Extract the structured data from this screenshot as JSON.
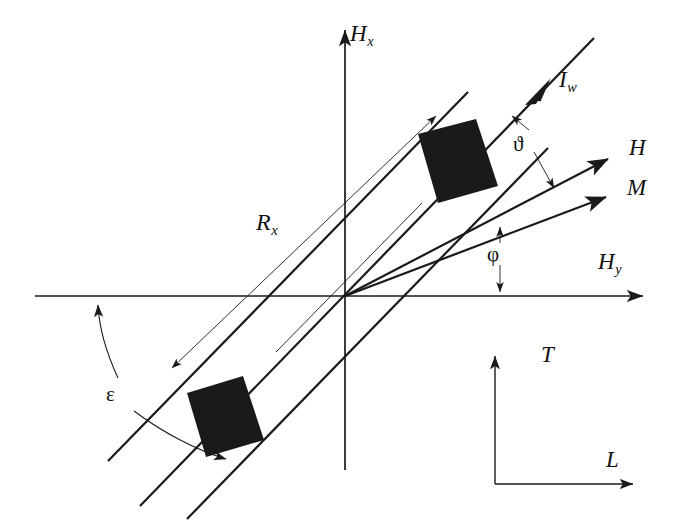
{
  "figure": {
    "type": "vector-diagram",
    "title": "",
    "background_color": "#ffffff",
    "stroke_color": "#1a1a1a",
    "fill_color": "#1a1a1a",
    "width": 674,
    "height": 531
  },
  "axes": {
    "vertical": {
      "label": "H",
      "subscript": "x",
      "label_x": 352,
      "label_y": 24,
      "from": [
        345,
        470
      ],
      "to": [
        345,
        28
      ],
      "arrow": "end"
    },
    "horizontal": {
      "label": "H",
      "subscript": "y",
      "label_x": 600,
      "label_y": 252,
      "from": [
        35,
        296
      ],
      "to": [
        645,
        296
      ],
      "arrow": "end"
    },
    "origin": [
      345,
      296
    ]
  },
  "vectors": [
    {
      "name": "current-wire-vector",
      "label": "I",
      "subscript": "w",
      "label_x": 560,
      "label_y": 70,
      "from": [
        140,
        506
      ],
      "to": [
        592,
        40
      ],
      "arrow_at": [
        540,
        93
      ],
      "style": "heavy"
    },
    {
      "label": "H",
      "subscript": "",
      "name": "field-vector",
      "label_x": 630,
      "label_y": 138,
      "from": [
        345,
        296
      ],
      "to": [
        610,
        158
      ],
      "arrow": "end",
      "style": "heavy"
    },
    {
      "label": "M",
      "subscript": "",
      "name": "magnetization-vector",
      "label_x": 628,
      "label_y": 178,
      "from": [
        345,
        296
      ],
      "to": [
        610,
        196
      ],
      "arrow": "end",
      "style": "heavy"
    },
    {
      "label": "R",
      "subscript": "x",
      "name": "rx-vector",
      "label_x": 258,
      "label_y": 212,
      "from": [
        168,
        372
      ],
      "to": [
        440,
        112
      ],
      "arrow": "both",
      "style": "thin"
    }
  ],
  "angles": [
    {
      "name": "theta-angle",
      "symbol": "ϑ",
      "label_x": 520,
      "label_y": 140,
      "between": [
        "I_w",
        "H"
      ],
      "leader_from": [
        519,
        133
      ],
      "leader_to_a": [
        506,
        112
      ],
      "leader_to_b": [
        536,
        185
      ]
    },
    {
      "name": "phi-angle",
      "symbol": "φ",
      "label_x": 493,
      "label_y": 253,
      "between": [
        "M",
        "H_y"
      ],
      "leader_to_a": [
        500,
        232
      ],
      "leader_to_b": [
        500,
        292
      ]
    },
    {
      "name": "epsilon-angle",
      "symbol": "ε",
      "label_x": 112,
      "label_y": 393,
      "between": [
        "H_y",
        "band-axis"
      ],
      "arc_upper_end": [
        98,
        299
      ],
      "arc_lower_end": [
        232,
        462
      ]
    }
  ],
  "band": {
    "name": "tilted-strip",
    "description": "long rectangular strip inclined at epsilon to the horizontal axis",
    "edge_a": [
      [
        108,
        461
      ],
      [
        468,
        92
      ]
    ],
    "edge_b": [
      [
        187,
        519
      ],
      [
        548,
        148
      ]
    ],
    "center_line": [
      [
        276,
        352
      ],
      [
        420,
        205
      ]
    ],
    "blocks": [
      {
        "name": "upper-block",
        "corners": [
          [
            420,
            133
          ],
          [
            476,
            120
          ],
          [
            496,
            186
          ],
          [
            438,
            203
          ]
        ],
        "fill": "#1a1a1a"
      },
      {
        "name": "lower-block",
        "corners": [
          [
            188,
            392
          ],
          [
            243,
            376
          ],
          [
            263,
            440
          ],
          [
            206,
            456
          ]
        ],
        "fill": "#1a1a1a"
      }
    ]
  },
  "inset_frame": {
    "name": "lt-coordinate-frame",
    "corner": [
      495,
      484
    ],
    "vertical": {
      "label": "T",
      "label_x": 543,
      "label_y": 345,
      "to": [
        495,
        353
      ],
      "arrow": "end"
    },
    "horizontal": {
      "label": "L",
      "label_x": 608,
      "label_y": 450,
      "to": [
        636,
        484
      ],
      "arrow": "end"
    }
  }
}
